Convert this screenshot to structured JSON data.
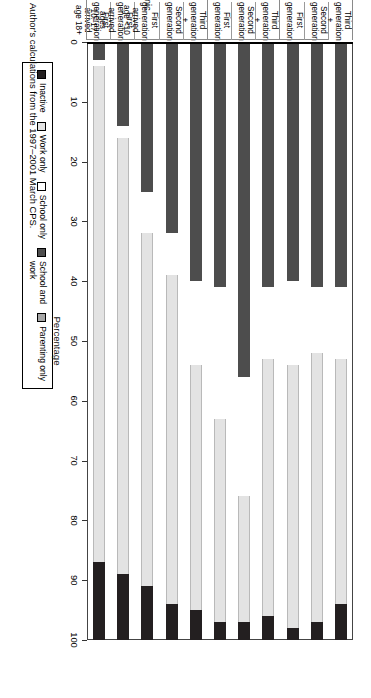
{
  "figure": {
    "source_note": "SOURCES: Author's calculations from the 1997–2001 March CPS."
  },
  "legend": {
    "items": [
      {
        "label": "Inactive",
        "key": "inactive",
        "color": "#231f20"
      },
      {
        "label": "Work only",
        "key": "work",
        "color": "#e3e3e3"
      },
      {
        "label": "School only",
        "key": "school",
        "color": "#ffffff"
      },
      {
        "label": "School and\nwork",
        "key": "schoolwork",
        "color": "#4d4d4d"
      },
      {
        "label": "Parenting only",
        "key": "parenting",
        "color": "#a6a6a6"
      }
    ]
  },
  "chart_data": {
    "type": "bar",
    "orientation": "horizontal-rotated",
    "title": "",
    "xlabel": "",
    "ylabel": "Percentage",
    "ylim": [
      0,
      100
    ],
    "yticks": [
      0,
      10,
      20,
      30,
      40,
      50,
      60,
      70,
      80,
      90,
      100
    ],
    "ytick_labels": [
      "0",
      "10",
      "20",
      "30",
      "40",
      "50",
      "60",
      "70",
      "80",
      "90",
      "100"
    ],
    "grid": false,
    "legend_position": "top-left",
    "stacked": true,
    "series": [
      {
        "name": "School and work",
        "key": "schoolwork",
        "color": "#4d4d4d",
        "values": [
          3,
          14,
          25,
          32,
          40,
          41,
          56,
          41,
          40,
          41,
          41
        ]
      },
      {
        "name": "School only",
        "key": "school",
        "color": "#ffffff",
        "values": [
          1,
          2,
          7,
          7,
          14,
          22,
          20,
          12,
          14,
          11,
          12
        ]
      },
      {
        "name": "Work only",
        "key": "work",
        "color": "#e3e3e3",
        "values": [
          83,
          73,
          59,
          55,
          41,
          34,
          21,
          43,
          44,
          45,
          41
        ]
      },
      {
        "name": "Inactive",
        "key": "inactive",
        "color": "#231f20",
        "values": [
          13,
          11,
          9,
          6,
          5,
          3,
          3,
          4,
          2,
          3,
          6
        ]
      }
    ],
    "categories": [
      {
        "label": "First\ngeneration\narrived\nage 18+",
        "group": "Hispanic"
      },
      {
        "label": "First\ngeneration\narrived\nages\n10–17",
        "group": "Hispanic"
      },
      {
        "label": "First\ngeneration\narrived\nage <10",
        "group": "Hispanic"
      },
      {
        "label": "Second\ngeneration",
        "group": "Hispanic"
      },
      {
        "label": "Third\ngeneration\n+",
        "group": "Hispanic"
      },
      {
        "label": "First\ngeneration",
        "group": "Asian"
      },
      {
        "label": "Second\ngeneration",
        "group": "Asian"
      },
      {
        "label": "Third\ngeneration\n+",
        "group": "Asian"
      },
      {
        "label": "First\ngeneration",
        "group": "White"
      },
      {
        "label": "Second\ngeneration",
        "group": "White"
      },
      {
        "label": "Third\ngeneration\n+",
        "group": "White"
      }
    ],
    "groups": [
      {
        "name": "Hispanic",
        "start": 0,
        "end": 4
      },
      {
        "name": "Asian",
        "start": 5,
        "end": 7
      },
      {
        "name": "White",
        "start": 8,
        "end": 10
      }
    ]
  }
}
